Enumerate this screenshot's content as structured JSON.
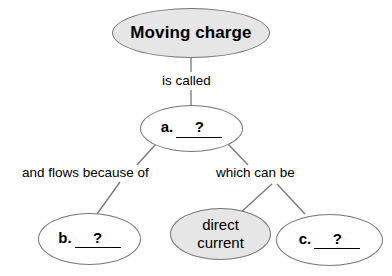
{
  "diagram": {
    "type": "concept-map",
    "title_node": {
      "label": "Moving charge",
      "fill": "#e6e6e6"
    },
    "edge_labels": {
      "is_called": "is called",
      "and_flows_because_of": "and flows because of",
      "which_can_be": "which can be"
    },
    "nodes": {
      "a": {
        "letter": "a.",
        "blank": "?",
        "fill": "#ffffff"
      },
      "b": {
        "letter": "b.",
        "blank": "?",
        "fill": "#ffffff"
      },
      "direct_current": {
        "line1": "direct",
        "line2": "current",
        "fill": "#e6e6e6"
      },
      "c": {
        "letter": "c.",
        "blank": "?",
        "fill": "#ffffff"
      }
    },
    "colors": {
      "background": "#ffffff",
      "stroke": "#767676",
      "text": "#000000",
      "shaded_fill": "#e6e6e6"
    }
  }
}
